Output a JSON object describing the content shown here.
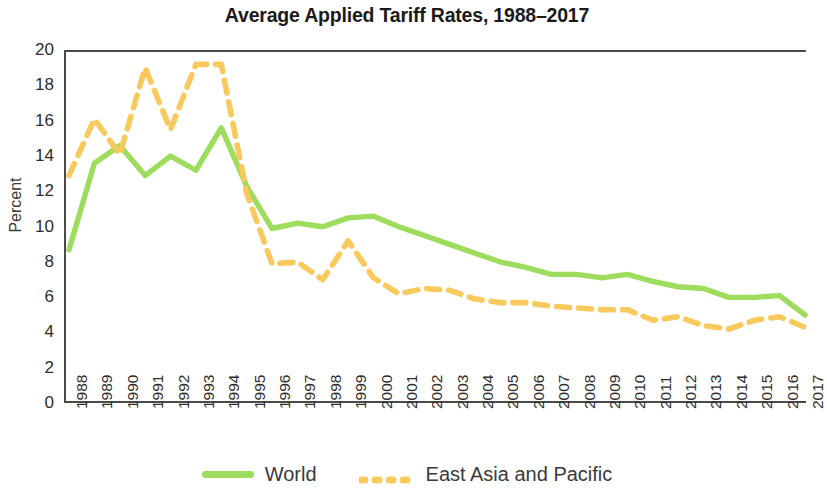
{
  "chart_data": {
    "type": "line",
    "title": "Average Applied Tariff Rates, 1988–2017",
    "xlabel": "",
    "ylabel": "Percent",
    "ylim": [
      0,
      20
    ],
    "yticks": [
      0,
      2,
      4,
      6,
      8,
      10,
      12,
      14,
      16,
      18,
      20
    ],
    "grid": false,
    "legend_position": "bottom",
    "categories": [
      "1988",
      "1989",
      "1990",
      "1991",
      "1992",
      "1993",
      "1994",
      "1995",
      "1996",
      "1997",
      "1998",
      "1999",
      "2000",
      "2001",
      "2002",
      "2003",
      "2004",
      "2005",
      "2006",
      "2007",
      "2008",
      "2009",
      "2010",
      "2011",
      "2012",
      "2013",
      "2014",
      "2015",
      "2016",
      "2017"
    ],
    "series": [
      {
        "name": "World",
        "style": "solid",
        "color": "#9ddc5c",
        "values": [
          8.8,
          13.7,
          14.7,
          13.0,
          14.1,
          13.3,
          15.7,
          12.4,
          10.0,
          10.3,
          10.1,
          10.6,
          10.7,
          10.1,
          9.6,
          9.1,
          8.6,
          8.1,
          7.8,
          7.4,
          7.4,
          7.2,
          7.4,
          7.0,
          6.7,
          6.6,
          6.1,
          6.1,
          6.2,
          5.1
        ]
      },
      {
        "name": "East Asia and Pacific",
        "style": "dashed",
        "color": "#f8c95c",
        "values": [
          13.0,
          16.2,
          14.2,
          19.1,
          15.6,
          19.3,
          19.3,
          12.0,
          8.0,
          8.1,
          7.1,
          9.3,
          7.2,
          6.3,
          6.6,
          6.5,
          6.0,
          5.8,
          5.8,
          5.6,
          5.5,
          5.4,
          5.4,
          4.8,
          5.0,
          4.5,
          4.3,
          4.8,
          5.0,
          4.4
        ]
      }
    ]
  },
  "legend": {
    "entries": [
      {
        "label": "World"
      },
      {
        "label": "East Asia and Pacific"
      }
    ]
  },
  "colors": {
    "world": "#9ddc5c",
    "east_asia_pacific": "#f8c95c",
    "axis": "#4a4a4a",
    "text": "#2d2d2d"
  }
}
